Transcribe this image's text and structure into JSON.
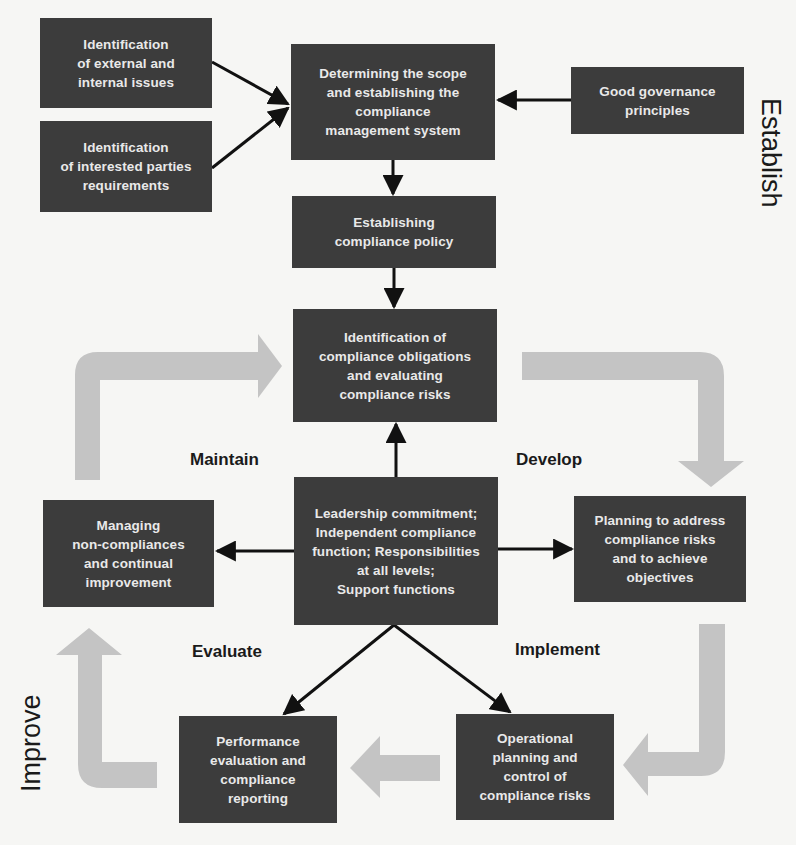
{
  "diagram": {
    "boxes": {
      "external_internal_issues": "Identification\nof external and\ninternal issues",
      "interested_parties": "Identification\nof interested parties\nrequirements",
      "determining_scope": "Determining the scope\nand establishing the\ncompliance\nmanagement system",
      "good_governance": "Good governance\nprinciples",
      "compliance_policy": "Establishing\ncompliance policy",
      "obligations_risks": "Identification of\ncompliance obligations\nand evaluating\ncompliance risks",
      "leadership": "Leadership commitment;\nIndependent compliance\nfunction; Responsibilities\nat all levels;\nSupport functions",
      "managing_noncompliance": "Managing\nnon-compliances\nand continual\nimprovement",
      "planning": "Planning to address\ncompliance risks\nand to achieve\nobjectives",
      "performance_evaluation": "Performance\nevaluation and\ncompliance\nreporting",
      "operational_planning": "Operational\nplanning and\ncontrol of\ncompliance risks"
    },
    "phases": {
      "maintain": "Maintain",
      "develop": "Develop",
      "evaluate": "Evaluate",
      "implement": "Implement"
    },
    "side_labels": {
      "establish": "Establish",
      "improve": "Improve"
    },
    "colors": {
      "box_fill": "#3c3c3c",
      "box_text": "#e9e9e9",
      "connector": "#111111",
      "cycle_arrow": "#c4c4c4",
      "background": "#f6f6f4"
    }
  }
}
